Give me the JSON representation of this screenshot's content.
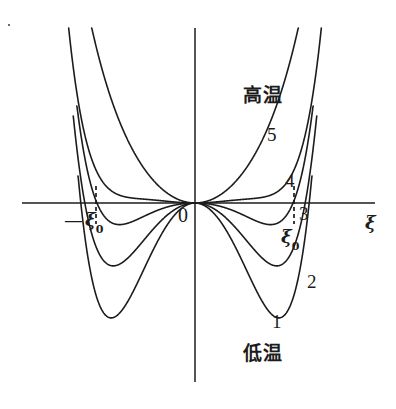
{
  "figure": {
    "background_color": "#ffffff",
    "line_color": "#1c1c1c",
    "text_color": "#1c1c1c"
  },
  "axes": {
    "x_axis_label": "ξ",
    "origin_label": "0",
    "x_axis": {
      "y_px": 203,
      "x_start_px": 22,
      "x_end_px": 375
    },
    "y_axis": {
      "x_px": 195,
      "y_start_px": 28,
      "y_end_px": 382
    }
  },
  "annotations": {
    "high_temp_label": "高温",
    "low_temp_label": "低温",
    "xi0_positive": "ξ",
    "xi0_positive_sub": "0",
    "xi0_negative_sign": "—",
    "xi0_negative": "ξ",
    "xi0_negative_sub": "0",
    "curve_labels": [
      "1",
      "2",
      "3",
      "4",
      "5"
    ],
    "marker_lines": [
      {
        "name": "negative-xi0-dashed",
        "x_px": 96
      },
      {
        "name": "positive-xi0-dashed",
        "x_px": 294
      }
    ]
  },
  "chart_data": {
    "type": "line",
    "xlabel": "ξ",
    "ylabel": "F",
    "grid": false,
    "legend": "inline-curve-numbers",
    "xlim": [
      -1.75,
      1.75
    ],
    "ylim": [
      -1.05,
      1.6
    ],
    "markers": {
      "xi0": 1.0,
      "minus_xi0": -1.0
    },
    "series": [
      {
        "name": "1",
        "label": "1",
        "temperature_rank": "lowest (低温)",
        "a": -2.45,
        "b": 1.15,
        "c": 0.52,
        "minimum_xi": 1.32,
        "minimum_F": -1.0,
        "points_x": [
          0.0,
          0.1,
          0.2,
          0.3,
          0.4,
          0.5,
          0.6,
          0.7,
          0.8,
          0.9,
          1.0,
          1.1,
          1.2,
          1.3,
          1.4,
          1.5,
          1.55
        ],
        "points_y": [
          0.0,
          -0.024,
          -0.096,
          -0.211,
          -0.362,
          -0.537,
          -0.722,
          -0.9,
          -1.05,
          -1.15,
          -1.19,
          -1.16,
          -1.05,
          -0.86,
          -0.55,
          -0.09,
          0.2
        ]
      },
      {
        "name": "2",
        "label": "2",
        "temperature_rank": "low",
        "a": -1.35,
        "b": 0.52,
        "c": 0.46,
        "minimum_xi": 1.12,
        "minimum_F": -0.62,
        "points_x": [
          0.0,
          0.1,
          0.2,
          0.3,
          0.4,
          0.5,
          0.6,
          0.7,
          0.8,
          0.9,
          1.0,
          1.1,
          1.2,
          1.3,
          1.4,
          1.45
        ],
        "points_y": [
          0.0,
          -0.013,
          -0.053,
          -0.117,
          -0.203,
          -0.305,
          -0.417,
          -0.53,
          -0.63,
          -0.705,
          -0.74,
          -0.72,
          -0.62,
          -0.41,
          -0.05,
          0.18
        ]
      },
      {
        "name": "3",
        "label": "3",
        "temperature_rank": "transition (F=0 at ±ξ₀)",
        "a": -0.42,
        "b": -0.18,
        "c": 0.62,
        "minimum_xi": 1.0,
        "minimum_F": 0.0,
        "points_x": [
          0.0,
          0.1,
          0.2,
          0.3,
          0.4,
          0.5,
          0.6,
          0.7,
          0.8,
          0.9,
          1.0,
          1.05,
          1.1,
          1.15,
          1.2
        ],
        "points_y": [
          0.0,
          -0.004,
          -0.017,
          -0.038,
          -0.066,
          -0.098,
          -0.13,
          -0.155,
          -0.163,
          -0.125,
          0.0,
          0.11,
          0.26,
          0.48,
          0.78
        ]
      },
      {
        "name": "4",
        "label": "4",
        "temperature_rank": "high",
        "a": 0.22,
        "b": -0.52,
        "c": 0.58,
        "local_min_xi": 0.95,
        "local_min_F": 0.1,
        "points_x": [
          0.0,
          0.1,
          0.2,
          0.3,
          0.4,
          0.5,
          0.6,
          0.7,
          0.8,
          0.9,
          1.0,
          1.05,
          1.1,
          1.15
        ],
        "points_y": [
          0.0,
          0.002,
          0.008,
          0.017,
          0.03,
          0.047,
          0.069,
          0.094,
          0.114,
          0.12,
          0.14,
          0.2,
          0.33,
          0.6
        ]
      },
      {
        "name": "5",
        "label": "5",
        "temperature_rank": "highest (高温)",
        "a": 1.05,
        "b": 0.18,
        "c": 0.1,
        "minimum_xi": 0.0,
        "minimum_F": 0.0,
        "points_x": [
          0.0,
          0.1,
          0.2,
          0.3,
          0.4,
          0.5,
          0.6,
          0.7,
          0.8,
          0.9,
          1.0,
          1.05
        ],
        "points_y": [
          0.0,
          0.011,
          0.043,
          0.098,
          0.178,
          0.285,
          0.42,
          0.59,
          0.79,
          1.03,
          1.33,
          1.5
        ]
      }
    ]
  }
}
